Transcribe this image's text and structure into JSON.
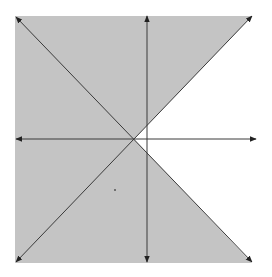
{
  "diagram": {
    "title": "",
    "colors": {
      "background": "#ffffff",
      "shade": "#c4c4c4",
      "line": "#3a3a3a"
    },
    "axes": {
      "horizontal": {
        "x1": 16,
        "y": 139,
        "x2": 256
      },
      "vertical": {
        "x": 147,
        "y1": 16,
        "y2": 262
      }
    },
    "lines": [
      {
        "name": "falling-diagonal",
        "x1": 16,
        "y1": 17,
        "x2": 252,
        "y2": 262
      },
      {
        "name": "rising-diagonal",
        "x1": 16,
        "y1": 262,
        "x2": 252,
        "y2": 16
      }
    ],
    "intersection": {
      "x": 134,
      "y": 139
    },
    "shaded_region": "outside the right wedge between the two diagonals",
    "points": [
      {
        "x": 115,
        "y": 190
      }
    ]
  }
}
